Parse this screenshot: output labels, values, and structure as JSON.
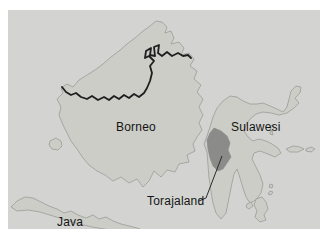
{
  "map": {
    "labels": {
      "borneo": "Borneo",
      "sulawesi": "Sulawesi",
      "torajaland": "Torajaland",
      "java": "Java"
    },
    "colors": {
      "page_bg": "#ffffff",
      "sea": "#d3d4d1",
      "land": "#cccdc7",
      "land_outline": "#9b9c97",
      "torajaland_fill": "#8b8c8a",
      "national_border": "#1e1e1e",
      "leader_line": "#2b2b2b",
      "label_text": "#141414"
    }
  }
}
